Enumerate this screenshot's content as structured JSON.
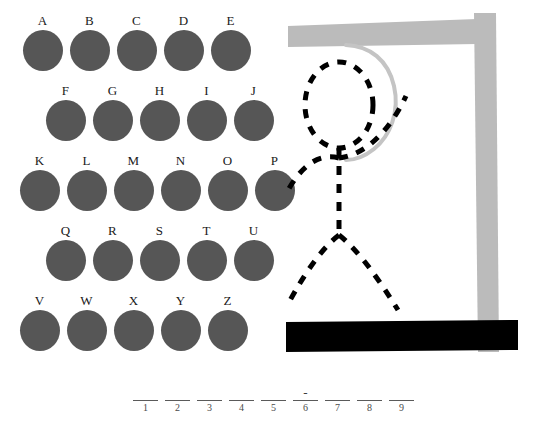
{
  "game": {
    "title": "Hangman",
    "colors": {
      "letter_disc": "#565656",
      "gallows": "#bbbbbb",
      "ground": "#000000",
      "figure": "#000000",
      "rope": "#c4c4c4",
      "text": "#1a1a1a",
      "background": "#ffffff"
    }
  },
  "keypad": {
    "name": "letter-keypad",
    "rows": [
      {
        "offset_left": 19,
        "offset_top": 14,
        "letters": [
          "A",
          "B",
          "C",
          "D",
          "E"
        ]
      },
      {
        "offset_left": 42,
        "offset_top": 84,
        "letters": [
          "F",
          "G",
          "H",
          "I",
          "J"
        ]
      },
      {
        "offset_left": 16,
        "offset_top": 154,
        "letters": [
          "K",
          "L",
          "M",
          "N",
          "O",
          "P"
        ]
      },
      {
        "offset_left": 42,
        "offset_top": 224,
        "letters": [
          "Q",
          "R",
          "S",
          "T",
          "U"
        ]
      },
      {
        "offset_left": 16,
        "offset_top": 294,
        "letters": [
          "V",
          "W",
          "X",
          "Y",
          "Z"
        ]
      }
    ]
  },
  "gallows": {
    "name": "gallows-scene",
    "parts_drawn": [
      "beam",
      "post",
      "rope",
      "head",
      "body",
      "left-arm",
      "right-arm",
      "left-leg",
      "right-leg"
    ],
    "ground_label": "ground-bar"
  },
  "word": {
    "name": "word-blanks",
    "length": 9,
    "slots": [
      {
        "index": "1",
        "revealed": ""
      },
      {
        "index": "2",
        "revealed": ""
      },
      {
        "index": "3",
        "revealed": ""
      },
      {
        "index": "4",
        "revealed": ""
      },
      {
        "index": "5",
        "revealed": ""
      },
      {
        "index": "6",
        "revealed": "-"
      },
      {
        "index": "7",
        "revealed": ""
      },
      {
        "index": "8",
        "revealed": ""
      },
      {
        "index": "9",
        "revealed": ""
      }
    ]
  }
}
